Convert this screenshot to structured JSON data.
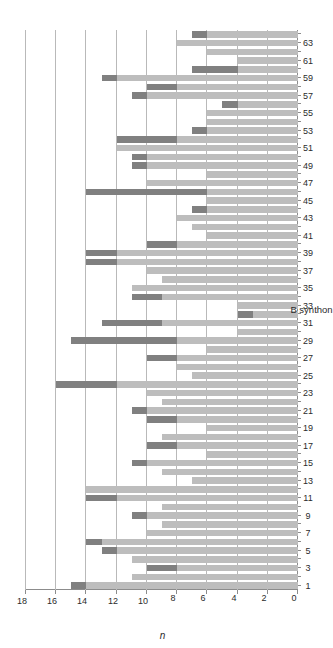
{
  "chart_data": {
    "type": "bar",
    "title": "",
    "subtitle": "",
    "xlabel": "B synthon",
    "ylabel": "n",
    "orientation": "horizontal-rotated",
    "stacked": true,
    "grid": true,
    "legend": null,
    "ylim": [
      0,
      18
    ],
    "yticks": [
      0,
      2,
      4,
      6,
      8,
      10,
      12,
      14,
      16,
      18
    ],
    "xtick_labels": [
      "1",
      "3",
      "5",
      "7",
      "9",
      "11",
      "13",
      "15",
      "17",
      "19",
      "21",
      "23",
      "25",
      "27",
      "29",
      "31",
      "33",
      "35",
      "37",
      "39",
      "41",
      "43",
      "45",
      "47",
      "49",
      "51",
      "53",
      "55",
      "57",
      "59",
      "61",
      "63"
    ],
    "colors": {
      "series_light": "#bdbdbd",
      "series_dark": "#808080",
      "grid": "#b9b9b9",
      "axis": "#8c8c8c",
      "text": "#2b2b2b",
      "background": "#ffffff"
    },
    "categories": [
      1,
      2,
      3,
      4,
      5,
      6,
      7,
      8,
      9,
      10,
      11,
      12,
      13,
      14,
      15,
      16,
      17,
      18,
      19,
      20,
      21,
      22,
      23,
      24,
      25,
      26,
      27,
      28,
      29,
      30,
      31,
      32,
      33,
      34,
      35,
      36,
      37,
      38,
      39,
      40,
      41,
      42,
      43,
      44,
      45,
      46,
      47,
      48,
      49,
      50,
      51,
      52,
      53,
      54,
      55,
      56,
      57,
      58,
      59,
      60,
      61,
      62,
      63,
      64
    ],
    "series": [
      {
        "name": "light",
        "values": [
          14,
          11,
          8,
          11,
          12,
          13,
          10,
          9,
          10,
          9,
          12,
          14,
          7,
          9,
          10,
          6,
          8,
          9,
          6,
          8,
          10,
          9,
          10,
          12,
          7,
          8,
          8,
          6,
          8,
          4,
          9,
          3,
          4,
          9,
          11,
          9,
          10,
          12,
          12,
          8,
          6,
          7,
          8,
          6,
          6,
          6,
          10,
          6,
          10,
          10,
          12,
          8,
          6,
          6,
          6,
          4,
          10,
          8,
          12,
          4,
          4,
          6,
          8,
          6
        ]
      },
      {
        "name": "dark",
        "values": [
          1,
          0,
          2,
          0,
          1,
          1,
          0,
          0,
          1,
          0,
          2,
          0,
          0,
          0,
          1,
          0,
          2,
          0,
          0,
          2,
          1,
          0,
          0,
          4,
          0,
          0,
          2,
          0,
          7,
          0,
          4,
          1,
          0,
          2,
          0,
          0,
          0,
          2,
          2,
          2,
          0,
          0,
          0,
          1,
          0,
          8,
          0,
          0,
          1,
          1,
          0,
          4,
          1,
          0,
          0,
          1,
          1,
          2,
          1,
          3,
          0,
          0,
          0,
          1
        ]
      }
    ]
  }
}
